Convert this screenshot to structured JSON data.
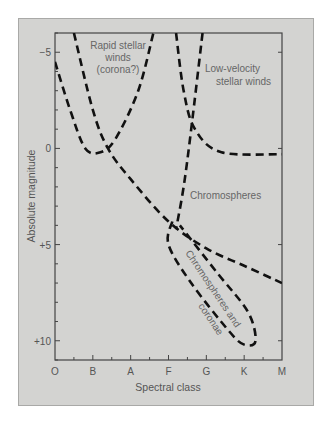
{
  "diagram": {
    "note": "Axis text and region labels are read directly from the figure. Curve points are approximate: they were traced from the drawn dashed lines and converted to axis units, since the figure prints no values for them.",
    "x_axis": {
      "title": "Spectral class",
      "ticks": [
        "O",
        "B",
        "A",
        "F",
        "G",
        "K",
        "M"
      ],
      "minor_ticks_between": true
    },
    "y_axis": {
      "title": "Absolute magnitude",
      "ticks": [
        {
          "value": -5,
          "label": "−5"
        },
        {
          "value": 0,
          "label": "0"
        },
        {
          "value": 5,
          "label": "+5"
        },
        {
          "value": 10,
          "label": "+10"
        }
      ],
      "range": [
        -6,
        11
      ],
      "inverted": true
    },
    "labels": {
      "rapid_winds": [
        "Rapid stellar",
        "winds",
        "(corona?)"
      ],
      "low_velocity_winds": [
        "Low-velocity",
        "stellar winds"
      ],
      "chromospheres": "Chromospheres",
      "chromospheres_coronae": [
        "Chromospheres and",
        "coronae"
      ]
    },
    "curves_approximate": [
      {
        "name": "rapid-winds-boundary",
        "points": [
          [
            0,
            -4.5
          ],
          [
            0.4,
            -2
          ],
          [
            0.8,
            0
          ],
          [
            1.2,
            0.2
          ],
          [
            1.6,
            -0.5
          ],
          [
            2.2,
            -3
          ],
          [
            2.6,
            -6
          ]
        ]
      },
      {
        "name": "main-sequence-diagonal",
        "points": [
          [
            0.5,
            -6
          ],
          [
            1,
            -2
          ],
          [
            1.4,
            0
          ],
          [
            2,
            1.6
          ],
          [
            3,
            3.8
          ],
          [
            4,
            5.2
          ],
          [
            5,
            6.1
          ],
          [
            6,
            7
          ]
        ]
      },
      {
        "name": "low-velocity-boundary",
        "points": [
          [
            3.2,
            -6
          ],
          [
            3.4,
            -3
          ],
          [
            3.7,
            -1
          ],
          [
            4.4,
            0.2
          ],
          [
            6,
            0.3
          ]
        ]
      },
      {
        "name": "chromosphere-boundary-vertical",
        "points": [
          [
            3.9,
            -6
          ],
          [
            3.6,
            -1
          ],
          [
            3.4,
            2
          ],
          [
            3.2,
            4.2
          ]
        ]
      },
      {
        "name": "chromosphere-corona-loop",
        "points": [
          [
            3.1,
            3.8
          ],
          [
            3,
            5
          ],
          [
            3.6,
            7
          ],
          [
            4.6,
            9.5
          ],
          [
            5,
            10.2
          ],
          [
            5.3,
            10
          ],
          [
            5.1,
            8.5
          ],
          [
            4.3,
            6.5
          ],
          [
            3.3,
            4
          ]
        ]
      }
    ]
  }
}
